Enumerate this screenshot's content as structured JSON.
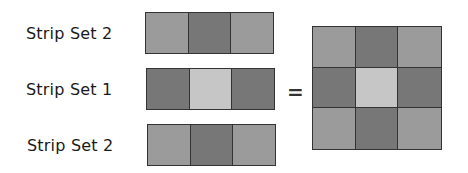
{
  "colors": {
    "medium": "#9b9b9b",
    "dark": "#777777",
    "light": "#c6c6c6",
    "outline": "#333333"
  },
  "strips": [
    {
      "label": "Strip Set 2",
      "patches": [
        "medium",
        "dark",
        "medium"
      ]
    },
    {
      "label": "Strip Set 1",
      "patches": [
        "dark",
        "light",
        "dark"
      ]
    },
    {
      "label": "Strip Set 2",
      "patches": [
        "medium",
        "dark",
        "medium"
      ]
    }
  ],
  "operator": "=",
  "result_block": {
    "rows": [
      [
        "medium",
        "dark",
        "medium"
      ],
      [
        "dark",
        "light",
        "dark"
      ],
      [
        "medium",
        "dark",
        "medium"
      ]
    ]
  }
}
